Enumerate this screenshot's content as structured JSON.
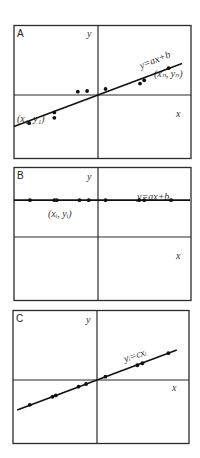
{
  "figure": {
    "panels": [
      {
        "id": "A",
        "letter": "A",
        "y_axis_label": "y",
        "x_axis_label": "x",
        "equation": "y=ax+b",
        "first_point_label": "(x₁, y₁)",
        "last_point_label": "(xₙ, yₙ)",
        "line": {
          "slope": 0.47,
          "intercept": 0.0
        },
        "points": [
          [
            -0.82,
            -0.42
          ],
          [
            -0.52,
            -0.26
          ],
          [
            -0.52,
            -0.34
          ],
          [
            -0.24,
            0.05
          ],
          [
            -0.13,
            0.06
          ],
          [
            0.09,
            0.09
          ],
          [
            0.5,
            0.17
          ],
          [
            0.55,
            0.22
          ],
          [
            0.84,
            0.4
          ]
        ]
      },
      {
        "id": "B",
        "letter": "B",
        "y_axis_label": "y",
        "x_axis_label": "x",
        "equation": "y=ax+b",
        "point_label": "(xᵢ, yᵢ)",
        "line": {
          "slope": 0.0,
          "intercept": 0.55
        },
        "points": [
          [
            -0.81,
            0.55
          ],
          [
            -0.52,
            0.55
          ],
          [
            -0.49,
            0.55
          ],
          [
            -0.22,
            0.55
          ],
          [
            -0.11,
            0.55
          ],
          [
            0.09,
            0.55
          ],
          [
            0.49,
            0.55
          ],
          [
            0.55,
            0.55
          ],
          [
            0.87,
            0.55
          ]
        ]
      },
      {
        "id": "C",
        "letter": "C",
        "y_axis_label": "y",
        "x_axis_label": "x",
        "equation": "yᵢ=cxᵢ",
        "line": {
          "slope": 0.47,
          "intercept": 0.0
        },
        "points": [
          [
            -0.8,
            -0.37
          ],
          [
            -0.53,
            -0.25
          ],
          [
            -0.49,
            -0.23
          ],
          [
            -0.22,
            -0.1
          ],
          [
            -0.13,
            -0.06
          ],
          [
            0.1,
            0.05
          ],
          [
            0.48,
            0.22
          ],
          [
            0.54,
            0.25
          ],
          [
            0.85,
            0.4
          ]
        ]
      }
    ]
  }
}
